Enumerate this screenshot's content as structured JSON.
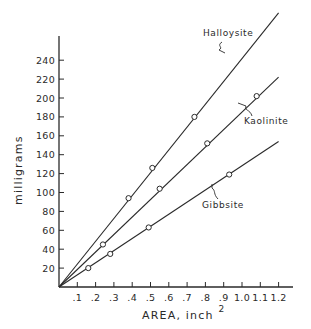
{
  "chart_data": {
    "type": "line",
    "title": "",
    "xlabel": "AREA, inch",
    "xlabel_superscript": "2",
    "ylabel": "milligrams",
    "xlim": [
      0,
      1.25
    ],
    "ylim": [
      0,
      260
    ],
    "grid": false,
    "legend": "inline labels on lines",
    "x_ticks": [
      0.1,
      0.2,
      0.3,
      0.4,
      0.5,
      0.6,
      0.7,
      0.8,
      0.9,
      1.0,
      1.1,
      1.2
    ],
    "x_tick_labels": [
      ".1",
      ".2",
      ".3",
      ".4",
      ".5",
      ".6",
      ".7",
      ".8",
      ".9",
      "1.0",
      "1.1",
      "1.2"
    ],
    "y_ticks": [
      20,
      40,
      60,
      80,
      100,
      120,
      140,
      160,
      180,
      200,
      220,
      240
    ],
    "y_tick_labels": [
      "20",
      "40",
      "60",
      "80",
      "100",
      "120",
      "140",
      "160",
      "180",
      "200",
      "220",
      "240"
    ],
    "series": [
      {
        "name": "Halloysite",
        "line_end": [
          1.2,
          290
        ],
        "points": [
          [
            0.38,
            94
          ],
          [
            0.51,
            126
          ],
          [
            0.74,
            180
          ]
        ],
        "label_pos": [
          203,
          36
        ],
        "leader": "M222,42 C216,46 224,47 219,50 L225,53"
      },
      {
        "name": "Kaolinite",
        "line_end": [
          1.2,
          222
        ],
        "points": [
          [
            0.24,
            45
          ],
          [
            0.55,
            104
          ],
          [
            0.81,
            152
          ],
          [
            1.08,
            202
          ]
        ],
        "label_pos": [
          244,
          124
        ],
        "leader": "M252,116 C250,109 244,111 246,106 L238,103"
      },
      {
        "name": "Gibbsite",
        "line_end": [
          1.2,
          154
        ],
        "points": [
          [
            0.16,
            20
          ],
          [
            0.28,
            35
          ],
          [
            0.49,
            63
          ],
          [
            0.93,
            119
          ]
        ],
        "label_pos": [
          202,
          208
        ],
        "leader": "M218,199 C213,194 216,191 212,188 L212,184"
      }
    ]
  }
}
